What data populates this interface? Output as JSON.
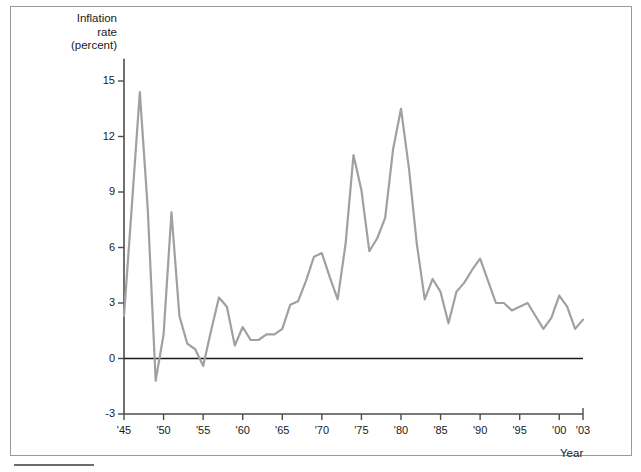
{
  "chart_data": {
    "type": "line",
    "title": "",
    "ylabel": "Inflation\nrate\n(percent)",
    "xlabel": "Year",
    "ylim": [
      -3,
      16.2
    ],
    "xlim": [
      1945,
      2003
    ],
    "grid": false,
    "legend": "none",
    "line_color": "#a0a0a0",
    "axis_color": "#4d4d4d",
    "zero_line_color": "#1a1a1a",
    "yticks": [
      15,
      12,
      9,
      6,
      3,
      0,
      -3
    ],
    "ytick_labels": [
      "15",
      "12",
      "9",
      "6",
      "3",
      "0",
      "-3"
    ],
    "xticks": [
      1945,
      1950,
      1955,
      1960,
      1965,
      1970,
      1975,
      1980,
      1985,
      1990,
      1995,
      2000,
      2003
    ],
    "xtick_labels": [
      "'45",
      "'50",
      "'55",
      "'60",
      "'65",
      "'70",
      "'75",
      "'80",
      "'85",
      "'90",
      "'95",
      "'00",
      "'03"
    ],
    "series": [
      {
        "name": "Inflation rate",
        "x": [
          1945,
          1946,
          1947,
          1948,
          1949,
          1950,
          1951,
          1952,
          1953,
          1954,
          1955,
          1956,
          1957,
          1958,
          1959,
          1960,
          1961,
          1962,
          1963,
          1964,
          1965,
          1966,
          1967,
          1968,
          1969,
          1970,
          1971,
          1972,
          1973,
          1974,
          1975,
          1976,
          1977,
          1978,
          1979,
          1980,
          1981,
          1982,
          1983,
          1984,
          1985,
          1986,
          1987,
          1988,
          1989,
          1990,
          1991,
          1992,
          1993,
          1994,
          1995,
          1996,
          1997,
          1998,
          1999,
          2000,
          2001,
          2002,
          2003
        ],
        "y": [
          2.3,
          8.3,
          14.4,
          8.1,
          -1.2,
          1.3,
          7.9,
          2.3,
          0.8,
          0.5,
          -0.4,
          1.5,
          3.3,
          2.8,
          0.7,
          1.7,
          1.0,
          1.0,
          1.3,
          1.3,
          1.6,
          2.9,
          3.1,
          4.2,
          5.5,
          5.7,
          4.4,
          3.2,
          6.2,
          11.0,
          9.1,
          5.8,
          6.5,
          7.6,
          11.3,
          13.5,
          10.3,
          6.2,
          3.2,
          4.3,
          3.6,
          1.9,
          3.6,
          4.1,
          4.8,
          5.4,
          4.2,
          3.0,
          3.0,
          2.6,
          2.8,
          3.0,
          2.3,
          1.6,
          2.2,
          3.4,
          2.8,
          1.6,
          2.1
        ]
      }
    ]
  },
  "axes": {
    "y_title": "Inflation\nrate\n(percent)",
    "x_title": "Year"
  }
}
